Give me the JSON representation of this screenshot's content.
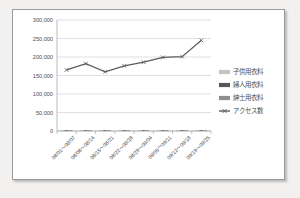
{
  "chart_data": {
    "type": "line",
    "title": "",
    "xlabel": "",
    "ylabel": "",
    "ylim": [
      0,
      300000
    ],
    "ytick_labels": [
      "300,000",
      "250,000",
      "200,000",
      "150,000",
      "100,000",
      "50,000",
      "0"
    ],
    "ytick_values": [
      300000,
      250000,
      200000,
      150000,
      100000,
      50000,
      0
    ],
    "grid": true,
    "legend_position": "right",
    "categories": [
      "08/01～08/07",
      "08/08～08/14",
      "08/15～08/21",
      "08/22～08/28",
      "08/29～09/04",
      "09/05～09/11",
      "09/12～09/18",
      "09/19～09/25"
    ],
    "series": [
      {
        "name": "子供用衣料",
        "type": "bar",
        "color": "#c4c4c4",
        "values": [
          900,
          800,
          700,
          1500,
          600,
          700,
          1300,
          1200
        ]
      },
      {
        "name": "婦人用衣料",
        "type": "bar",
        "color": "#575757",
        "values": [
          1100,
          1000,
          900,
          2000,
          800,
          900,
          1700,
          1600
        ]
      },
      {
        "name": "紳士用衣料",
        "type": "bar",
        "color": "#8e8e8e",
        "values": [
          700,
          600,
          600,
          1200,
          500,
          600,
          1000,
          1000
        ]
      },
      {
        "name": "アクセス数",
        "type": "line",
        "color": "#5c5c5c",
        "values": [
          165000,
          182000,
          160000,
          176000,
          186000,
          199000,
          201000,
          245000
        ]
      }
    ]
  },
  "legend": {
    "items": [
      {
        "label": "子供用衣料",
        "swatch": "#c4c4c4",
        "marker": "bar"
      },
      {
        "label": "婦人用衣料",
        "swatch": "#575757",
        "marker": "bar"
      },
      {
        "label": "紳士用衣料",
        "swatch": "#8e8e8e",
        "marker": "bar"
      },
      {
        "label": "アクセス数",
        "swatch": "#5c5c5c",
        "marker": "line"
      }
    ]
  }
}
